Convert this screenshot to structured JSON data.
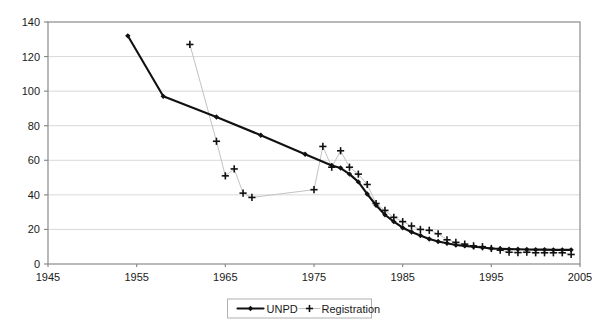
{
  "chart_data": {
    "type": "line",
    "title": "",
    "subtitle": "",
    "xlabel": "",
    "ylabel": "",
    "xlim": [
      1945,
      2005
    ],
    "ylim": [
      0,
      140
    ],
    "xticks": [
      1945,
      1955,
      1965,
      1975,
      1985,
      1995,
      2005
    ],
    "yticks": [
      0,
      20,
      40,
      60,
      80,
      100,
      120,
      140
    ],
    "xtick_labels": [
      "1945",
      "1955",
      "1965",
      "1975",
      "1985",
      "1995",
      "2005"
    ],
    "ytick_labels": [
      "0",
      "20",
      "40",
      "60",
      "80",
      "100",
      "120",
      "140"
    ],
    "grid": "horizontal",
    "legend_position": "bottom-center",
    "colors": {
      "unpd": "#111111",
      "registration_marker": "#111111",
      "registration_line": "#c2c2c2",
      "gridline": "#d9d9d9",
      "axis": "#8a8a8a",
      "background": "#ffffff"
    },
    "series": [
      {
        "name": "UNPD",
        "marker": "diamond",
        "line": "solid",
        "x": [
          1954,
          1958,
          1964,
          1969,
          1974,
          1977,
          1978,
          1979,
          1980,
          1981,
          1982,
          1983,
          1984,
          1985,
          1986,
          1987,
          1988,
          1989,
          1990,
          1991,
          1992,
          1993,
          1994,
          1995,
          1996,
          1997,
          1998,
          1999,
          2000,
          2001,
          2002,
          2003,
          2004
        ],
        "values": [
          132,
          97,
          85,
          74.5,
          63.5,
          57,
          55.5,
          52,
          47.5,
          40.5,
          34,
          28.5,
          24.5,
          21,
          18.5,
          16.5,
          14.5,
          13,
          12,
          11,
          10.5,
          10,
          9.5,
          9,
          8.8,
          8.6,
          8.5,
          8.4,
          8.3,
          8.3,
          8.2,
          8.2,
          8.2
        ]
      },
      {
        "name": "Registration",
        "marker": "plus",
        "line": "thin-gray",
        "x": [
          1961,
          1964,
          1965,
          1966,
          1967,
          1968,
          1975,
          1976,
          1977,
          1978,
          1979,
          1980,
          1981,
          1982,
          1983,
          1984,
          1985,
          1986,
          1987,
          1988,
          1989,
          1990,
          1991,
          1992,
          1993,
          1994,
          1995,
          1996,
          1997,
          1998,
          1999,
          2000,
          2001,
          2002,
          2003,
          2004
        ],
        "values": [
          127,
          71,
          51,
          55,
          41,
          38.5,
          43,
          68,
          56,
          65.5,
          56,
          52,
          46,
          35,
          31,
          27,
          24.5,
          22,
          20,
          19.5,
          17.5,
          14,
          12.5,
          11.5,
          10.5,
          10,
          9,
          8,
          6.8,
          6.6,
          6.8,
          6.5,
          6.5,
          6.5,
          6.5,
          5.5
        ]
      }
    ]
  },
  "legend": {
    "items": [
      {
        "label": "UNPD",
        "marker": "diamond-line"
      },
      {
        "label": "Registration",
        "marker": "plus"
      }
    ]
  }
}
